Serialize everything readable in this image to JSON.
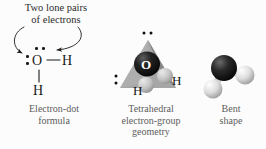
{
  "figure": {
    "background_color": "#fcfcfc",
    "ink_color": "#1a1a1a",
    "caption_color": "#5d5d5d"
  },
  "annotation": {
    "line1": "Two lone pairs",
    "line2": "of electrons",
    "arrow_count": 2
  },
  "panels": {
    "lewis": {
      "caption_line1": "Electron-dot",
      "caption_line2": "formula",
      "central_atom": "O",
      "hydrogen_right": "H",
      "hydrogen_bottom": "H",
      "lone_pairs": 2,
      "bonds": 2
    },
    "tetrahedral": {
      "caption_line1": "Tetrahedral",
      "caption_line2": "electron-group",
      "caption_line3": "geometry",
      "central_atom": "O",
      "hydrogen_left": "H",
      "hydrogen_right": "H",
      "lone_pairs": 2,
      "shape_color": "#9a9a9a",
      "oxygen_color": "#141414",
      "hydrogen_color": "#b9b9b9"
    },
    "bent": {
      "caption_line1": "Bent",
      "caption_line2": "shape",
      "oxygen_color": "#161616",
      "hydrogen_color": "#d8d8d8"
    }
  }
}
